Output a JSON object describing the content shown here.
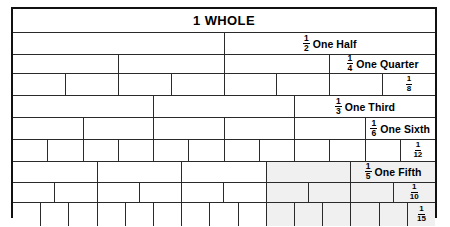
{
  "colors": {
    "border": "#111111",
    "grid": "#2a2a2a",
    "shaded_cell": "#f0f0f0",
    "background": "#ffffff",
    "text": "#000000"
  },
  "chart_data": {
    "type": "bar",
    "title": "1 WHOLE",
    "xlabel": "",
    "ylabel": "",
    "rows": [
      {
        "id": "whole",
        "denominator": 1,
        "parts": 1,
        "label": "1 WHOLE",
        "label_cell_index": 0,
        "label_style": "title",
        "shaded_from_index": null,
        "value_per_part": 1.0
      },
      {
        "id": "half",
        "denominator": 2,
        "parts": 2,
        "numerator": "1",
        "name": "One Half",
        "label_cell_index": 1,
        "label_style": "fraction",
        "shaded_from_index": null,
        "value_per_part": 0.5
      },
      {
        "id": "quarter",
        "denominator": 4,
        "parts": 4,
        "numerator": "1",
        "name": "One Quarter",
        "label_cell_index": 3,
        "label_style": "fraction",
        "shaded_from_index": null,
        "value_per_part": 0.25
      },
      {
        "id": "eighth",
        "denominator": 8,
        "parts": 8,
        "numerator": "1",
        "name": "",
        "label_cell_index": 7,
        "label_style": "fraction",
        "shaded_from_index": null,
        "value_per_part": 0.125
      },
      {
        "id": "third",
        "denominator": 3,
        "parts": 3,
        "numerator": "1",
        "name": "One Third",
        "label_cell_index": 2,
        "label_style": "fraction",
        "shaded_from_index": null,
        "value_per_part": 0.3333
      },
      {
        "id": "sixth",
        "denominator": 6,
        "parts": 6,
        "numerator": "1",
        "name": "One Sixth",
        "label_cell_index": 5,
        "label_style": "fraction",
        "shaded_from_index": null,
        "value_per_part": 0.1667
      },
      {
        "id": "twelfth",
        "denominator": 12,
        "parts": 12,
        "numerator": "1",
        "name": "",
        "label_cell_index": 11,
        "label_style": "fraction",
        "shaded_from_index": null,
        "value_per_part": 0.0833
      },
      {
        "id": "fifth",
        "denominator": 5,
        "parts": 5,
        "numerator": "1",
        "name": "One Fifth",
        "label_cell_index": 4,
        "label_style": "fraction",
        "shaded_from_index": 3,
        "value_per_part": 0.2
      },
      {
        "id": "tenth",
        "denominator": 10,
        "parts": 10,
        "numerator": "1",
        "name": "",
        "label_cell_index": 9,
        "label_style": "fraction",
        "shaded_from_index": 6,
        "value_per_part": 0.1
      },
      {
        "id": "fifteenth",
        "denominator": 15,
        "parts": 15,
        "numerator": "1",
        "name": "",
        "label_cell_index": 14,
        "label_style": "fraction",
        "shaded_from_index": 9,
        "value_per_part": 0.0667
      }
    ]
  }
}
